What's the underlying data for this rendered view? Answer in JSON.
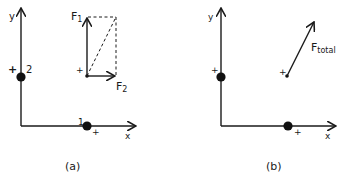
{
  "panels": [
    {
      "caption": "(a)",
      "axis_labels": {
        "x": "x",
        "y": "y"
      },
      "charges": [
        {
          "id": "2",
          "label": "2",
          "sign": "+"
        },
        {
          "id": "1",
          "label": "1",
          "sign": "+"
        }
      ],
      "test_point": {
        "sign": "+"
      },
      "vectors": [
        {
          "name": "F1",
          "base": "F",
          "sub": "1",
          "direction": "up"
        },
        {
          "name": "F2",
          "base": "F",
          "sub": "2",
          "direction": "right"
        }
      ],
      "construction": "dashed parallelogram completing F1 + F2 with diagonal"
    },
    {
      "caption": "(b)",
      "axis_labels": {
        "x": "x",
        "y": "y"
      },
      "charges": [
        {
          "id": "2",
          "sign": "+"
        },
        {
          "id": "1",
          "sign": "+"
        }
      ],
      "test_point": {
        "sign": "+"
      },
      "vectors": [
        {
          "name": "Ftotal",
          "base": "F",
          "sub": "total",
          "direction": "up-right"
        }
      ]
    }
  ]
}
